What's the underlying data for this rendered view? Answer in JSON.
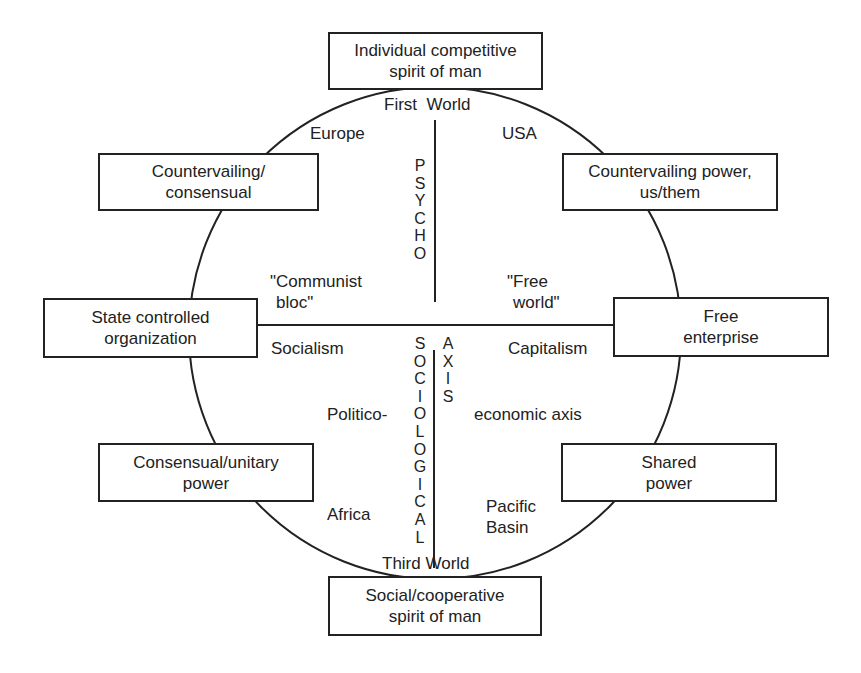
{
  "diagram": {
    "boxes": {
      "top": [
        "Individual competitive",
        "spirit of man"
      ],
      "upper_left": [
        "Countervailing/",
        "consensual"
      ],
      "upper_right": [
        "Countervailing power,",
        "us/them"
      ],
      "left": [
        "State controlled",
        "organization"
      ],
      "right": [
        "Free",
        "enterprise"
      ],
      "lower_left": [
        "Consensual/unitary",
        "power"
      ],
      "lower_right": [
        "Shared",
        "power"
      ],
      "bottom": [
        "Social/cooperative",
        "spirit of man"
      ]
    },
    "labels": {
      "first_world": "First  World",
      "third_world": "Third World",
      "europe": "Europe",
      "usa": "USA",
      "communist_bloc": [
        "\"Communist",
        "bloc\""
      ],
      "free_world": [
        "\"Free",
        "world\""
      ],
      "socialism": "Socialism",
      "capitalism": "Capitalism",
      "politico": "Politico-",
      "economic_axis": "economic axis",
      "africa": "Africa",
      "pacific_basin": [
        "Pacific",
        "Basin"
      ]
    },
    "vertical_text": {
      "psycho": [
        "P",
        "S",
        "Y",
        "C",
        "H",
        "O"
      ],
      "sociological": [
        "S",
        "O",
        "C",
        "I",
        "O",
        "L",
        "O",
        "G",
        "I",
        "C",
        "A",
        "L"
      ],
      "axis": [
        "A",
        "X",
        "I",
        "S"
      ]
    },
    "colors": {
      "line": "#222222",
      "background": "#ffffff"
    }
  }
}
